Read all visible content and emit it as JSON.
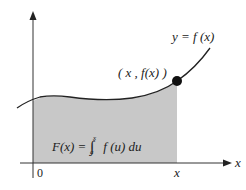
{
  "diagram": {
    "curve_label": "y = f (x)",
    "point_label": "( x , f(x) )",
    "formula": {
      "lhs": "F(x) =",
      "integral_sign": "∫",
      "upper_limit": "x",
      "lower_limit": "a",
      "integrand": "f (u) du"
    },
    "x_axis_label": "x",
    "origin_label": "0",
    "x_tick_label": "x",
    "colors": {
      "shade": "#c8c8c8",
      "curve": "#222222",
      "axis": "#333333",
      "point": "#111111"
    }
  }
}
